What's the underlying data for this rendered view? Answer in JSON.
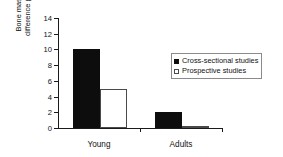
{
  "chart_data": {
    "type": "bar",
    "title": "",
    "xlabel": "",
    "ylabel": "Bone mass difference (%)",
    "ylabel_lines": [
      "Bone mass",
      "difference (%)"
    ],
    "categories": [
      "Young",
      "Adults"
    ],
    "series": [
      {
        "name": "Cross-sectional studies",
        "swatch": "filled-square",
        "color": "#0d0d0d",
        "values": [
          10,
          2
        ]
      },
      {
        "name": "Prospective studies",
        "swatch": "open-square",
        "color": "#ffffff",
        "values": [
          5,
          0.1
        ]
      }
    ],
    "ylim": [
      0,
      14
    ],
    "yticks": [
      0,
      2,
      4,
      6,
      8,
      10,
      12,
      14
    ],
    "ytick_labels": [
      "0",
      "2",
      "4",
      "6",
      "8",
      "10",
      "12",
      "14"
    ],
    "grid": false,
    "legend_position": "upper right",
    "axis_color": "#1a1a1a"
  },
  "legend": {
    "items": [
      {
        "label": "Cross-sectional studies",
        "style": "filled"
      },
      {
        "label": "Prospective studies",
        "style": "open"
      }
    ]
  }
}
